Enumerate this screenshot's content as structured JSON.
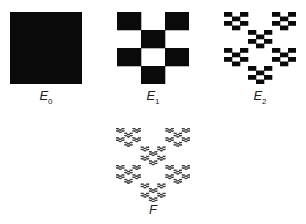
{
  "figures": [
    {
      "id": "E0",
      "label": "E",
      "subscript": "0",
      "level": 0
    },
    {
      "id": "E1",
      "label": "E",
      "subscript": "1",
      "level": 1
    },
    {
      "id": "E2",
      "label": "E",
      "subscript": "2",
      "level": 2
    },
    {
      "id": "F",
      "label": "F",
      "subscript": "",
      "level": "limit"
    }
  ],
  "pattern": {
    "grid_cols": 3,
    "grid_rows": 4,
    "kept_cells": [
      [
        0,
        0
      ],
      [
        2,
        0
      ],
      [
        1,
        1
      ],
      [
        0,
        2
      ],
      [
        2,
        2
      ],
      [
        1,
        3
      ]
    ]
  },
  "colors": {
    "fill": "#0a0a0a",
    "background": "#ffffff"
  }
}
